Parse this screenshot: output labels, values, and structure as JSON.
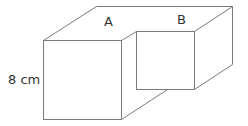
{
  "diagram": {
    "type": "3d-shape",
    "labels": {
      "cube_a": "A",
      "cube_b": "B",
      "dimension": "8 cm"
    },
    "colors": {
      "edge": "#7a7a7a",
      "text": "#333333",
      "background": "#ffffff"
    }
  }
}
